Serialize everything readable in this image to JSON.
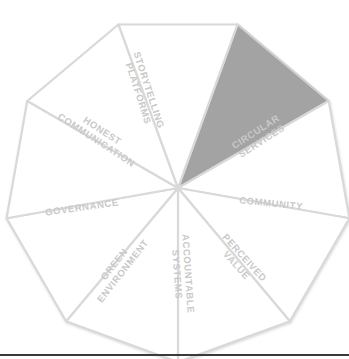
{
  "diagram": {
    "shape": "nonagon",
    "segment_count": 9,
    "center": {
      "x": 178,
      "y": 188
    },
    "outer_radius": 174,
    "start_angle_deg": -70,
    "colors": {
      "highlight_fill": "#a3a3a3",
      "default_fill": "#ffffff",
      "stroke": "#d9d9d9",
      "stroke_inner": "#e2e2e2",
      "label_default": "#c9c9c9",
      "label_highlight": "#ffffff",
      "bottom_rule": "#3a3a3a",
      "background": "#ffffff"
    },
    "segments": [
      {
        "id": "conscious-item",
        "label": "CONSCIOUS ITEM",
        "lines": [
          "CONSCIOUS",
          "ITEM"
        ],
        "highlighted": true,
        "index": 0,
        "label_x": 198,
        "label_y": 88,
        "label_rotation_deg": -72,
        "font_size": 9.5,
        "line_height": 11
      },
      {
        "id": "circular-services",
        "label": "CIRCULAR SERVICES",
        "lines": [
          "CIRCULAR",
          "SERVICES"
        ],
        "highlighted": false,
        "index": 1,
        "label_x": 259,
        "label_y": 137,
        "label_rotation_deg": -33,
        "font_size": 9.5,
        "line_height": 11
      },
      {
        "id": "community",
        "label": "COMMUNITY",
        "lines": [
          "COMMUNITY"
        ],
        "highlighted": false,
        "index": 2,
        "label_x": 271,
        "label_y": 204,
        "label_rotation_deg": 6,
        "font_size": 9.5,
        "line_height": 11
      },
      {
        "id": "perceived-value",
        "label": "PERCEIVED VALUE",
        "lines": [
          "PERCEIVED",
          "VALUE"
        ],
        "highlighted": false,
        "index": 3,
        "label_x": 240,
        "label_y": 262,
        "label_rotation_deg": 48,
        "font_size": 9.5,
        "line_height": 11
      },
      {
        "id": "accountable-systems",
        "label": "ACCOUNTABLE SYSTEMS",
        "lines": [
          "ACCOUNTABLE",
          "SYSTEMS"
        ],
        "highlighted": false,
        "index": 4,
        "label_x": 182,
        "label_y": 274,
        "label_rotation_deg": 86,
        "font_size": 9.5,
        "line_height": 11
      },
      {
        "id": "green-environment",
        "label": "GREEN ENVIRONMENT",
        "lines": [
          "GREEN",
          "ENVIRONMENT"
        ],
        "highlighted": false,
        "index": 5,
        "label_x": 119,
        "label_y": 268,
        "label_rotation_deg": -52,
        "font_size": 9.5,
        "line_height": 11
      },
      {
        "id": "governance",
        "label": "GOVERNANCE",
        "lines": [
          "GOVERNANCE"
        ],
        "highlighted": false,
        "index": 6,
        "label_x": 82,
        "label_y": 208,
        "label_rotation_deg": -8,
        "font_size": 9.5,
        "line_height": 11
      },
      {
        "id": "honest-communication",
        "label": "HONEST COMMUNICATION",
        "lines": [
          "HONEST",
          "COMMUNICATION"
        ],
        "highlighted": false,
        "index": 7,
        "label_x": 99,
        "label_y": 136,
        "label_rotation_deg": 33,
        "font_size": 9.5,
        "line_height": 11
      },
      {
        "id": "storytelling-platforms",
        "label": "STORYTELLING PLATFORMS",
        "lines": [
          "STORYTELLING",
          "PLATFORMS"
        ],
        "highlighted": false,
        "index": 8,
        "label_x": 143,
        "label_y": 92,
        "label_rotation_deg": 72,
        "font_size": 9.5,
        "line_height": 11
      }
    ]
  }
}
